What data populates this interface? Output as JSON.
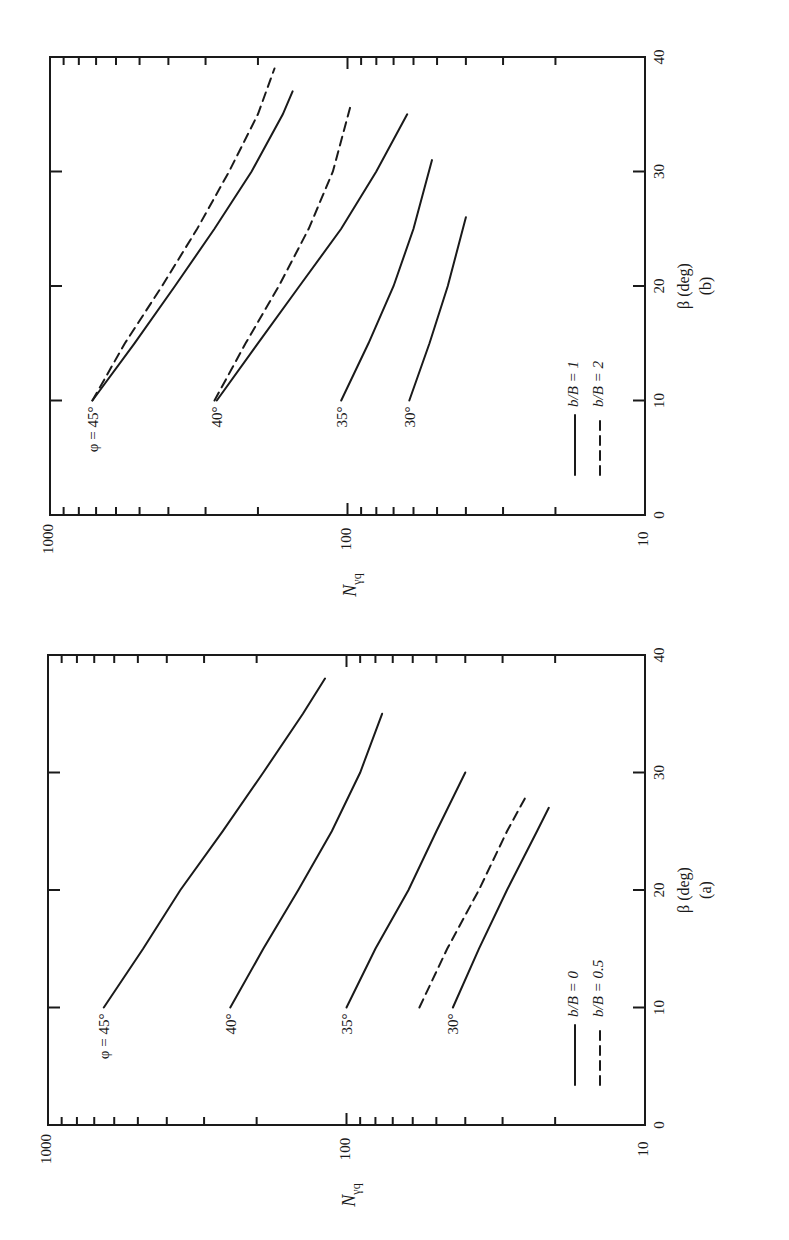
{
  "chart_data": [
    {
      "panel": "(a)",
      "type": "line",
      "orientation": "rotated 90° counter-clockwise (page reads sideways)",
      "title": "",
      "caption": "(a)",
      "xlabel": "β (deg)",
      "ylabel": "Nγq",
      "xlim": [
        0,
        40
      ],
      "ylim": [
        10,
        1000
      ],
      "yscale": "log",
      "x_ticks": [
        "0",
        "10",
        "20",
        "30",
        "40"
      ],
      "y_ticks": [
        "10",
        "100",
        "1000"
      ],
      "grid": false,
      "legend": [
        {
          "label": "b/B = 0",
          "style": "solid"
        },
        {
          "label": "b/B = 0.5",
          "style": "dashed"
        }
      ],
      "series": [
        {
          "name": "φ = 45°, b/B = 0",
          "label": "φ = 45°",
          "style": "solid",
          "x": [
            10,
            15,
            20,
            25,
            30,
            35,
            38
          ],
          "y": [
            650,
            480,
            360,
            260,
            190,
            140,
            118
          ]
        },
        {
          "name": "φ = 40°, b/B = 0",
          "label": "40°",
          "style": "solid",
          "x": [
            10,
            15,
            20,
            25,
            30,
            35
          ],
          "y": [
            245,
            190,
            145,
            112,
            90,
            76
          ]
        },
        {
          "name": "φ = 35°, b/B = 0",
          "label": "35°",
          "style": "solid",
          "x": [
            10,
            15,
            20,
            25,
            30
          ],
          "y": [
            100,
            80,
            62,
            50,
            40
          ]
        },
        {
          "name": "φ = 30°, b/B = 0",
          "label": "30°",
          "style": "solid",
          "x": [
            10,
            15,
            20,
            25,
            27
          ],
          "y": [
            44,
            36,
            29,
            23,
            21
          ]
        },
        {
          "name": "φ = 30°, b/B = 0.5",
          "label": "",
          "style": "dashed",
          "x": [
            10,
            15,
            20,
            25,
            28
          ],
          "y": [
            57,
            46,
            36,
            29,
            25
          ]
        }
      ]
    },
    {
      "panel": "(b)",
      "type": "line",
      "orientation": "rotated 90° counter-clockwise (page reads sideways)",
      "title": "",
      "caption": "(b)",
      "xlabel": "β (deg)",
      "ylabel": "Nγq",
      "xlim": [
        0,
        40
      ],
      "ylim": [
        10,
        1000
      ],
      "yscale": "log",
      "x_ticks": [
        "0",
        "10",
        "20",
        "30",
        "40"
      ],
      "y_ticks": [
        "10",
        "100",
        "1000"
      ],
      "grid": false,
      "legend": [
        {
          "label": "b/B = 1",
          "style": "solid"
        },
        {
          "label": "b/B = 2",
          "style": "dashed"
        }
      ],
      "series": [
        {
          "name": "φ = 45°, b/B = 1",
          "label": "φ = 45°",
          "style": "solid",
          "x": [
            10,
            15,
            20,
            25,
            30,
            35,
            37
          ],
          "y": [
            720,
            520,
            380,
            280,
            210,
            165,
            153
          ]
        },
        {
          "name": "φ = 45°, b/B = 2",
          "label": "",
          "style": "dashed",
          "x": [
            10,
            15,
            20,
            25,
            30,
            35,
            39
          ],
          "y": [
            720,
            560,
            420,
            320,
            250,
            200,
            176
          ]
        },
        {
          "name": "φ = 40°, b/B = 1",
          "label": "40°",
          "style": "solid",
          "x": [
            10,
            15,
            20,
            25,
            30,
            35
          ],
          "y": [
            275,
            200,
            145,
            105,
            80,
            63
          ]
        },
        {
          "name": "φ = 40°, b/B = 2",
          "label": "",
          "style": "dashed",
          "x": [
            10,
            15,
            20,
            25,
            30,
            36
          ],
          "y": [
            280,
            220,
            170,
            135,
            112,
            97
          ]
        },
        {
          "name": "φ = 35°, b/B = 1",
          "label": "35°",
          "style": "solid",
          "x": [
            10,
            15,
            20,
            25,
            31
          ],
          "y": [
            105,
            85,
            70,
            60,
            52
          ]
        },
        {
          "name": "φ = 30°, b/B = 1",
          "label": "30°",
          "style": "solid",
          "x": [
            10,
            15,
            20,
            26
          ],
          "y": [
            62,
            53,
            46,
            40
          ]
        }
      ]
    }
  ],
  "panels": {
    "a": {
      "caption": "(a)",
      "xlabel": "β (deg)",
      "ylabel_main": "N",
      "ylabel_sub": "γq",
      "legend_solid": "b/B = 0",
      "legend_dashed": "b/B = 0.5"
    },
    "b": {
      "caption": "(b)",
      "xlabel": "β (deg)",
      "ylabel_main": "N",
      "ylabel_sub": "γq",
      "legend_solid": "b/B = 1",
      "legend_dashed": "b/B = 2"
    }
  }
}
